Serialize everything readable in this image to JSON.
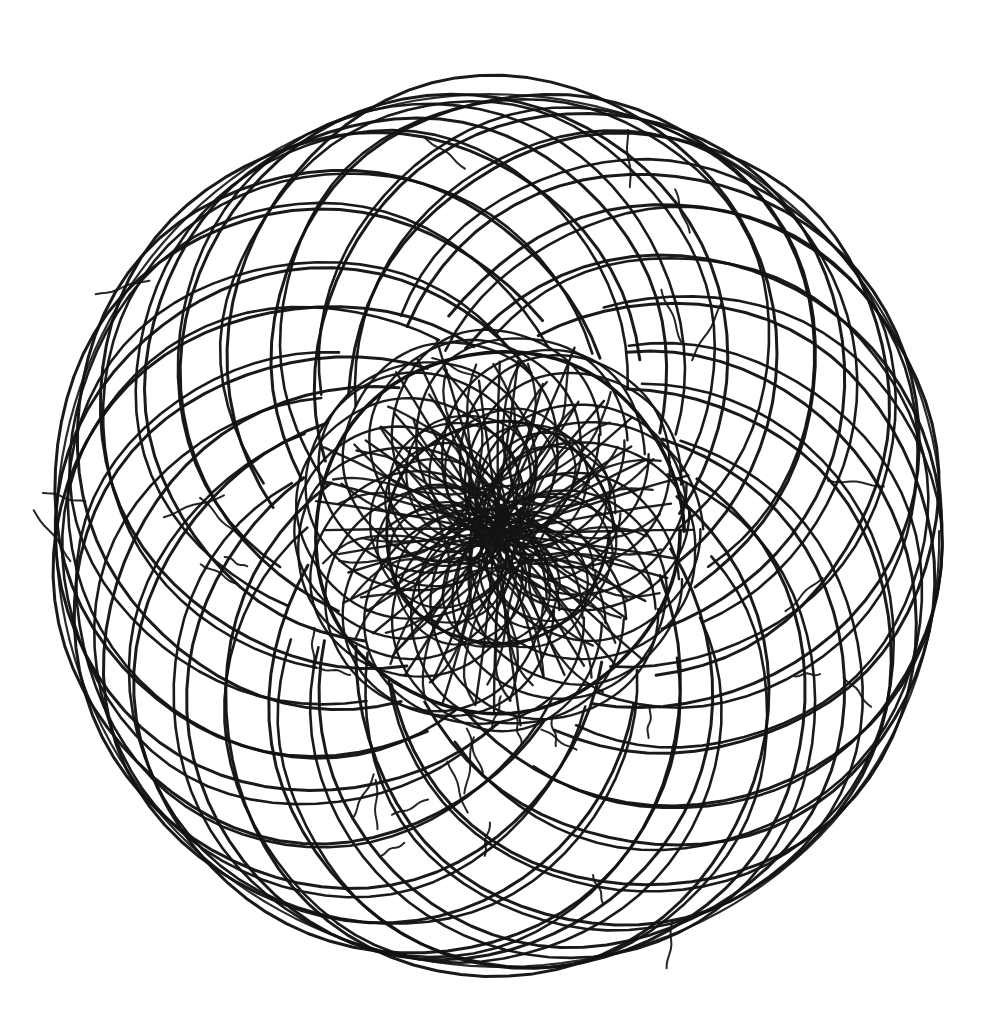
{
  "canvas": {
    "width": 1006,
    "height": 1025,
    "background_color": "#ffffff",
    "ink_color": "#131313"
  },
  "artwork": {
    "title": "Hand-drawn spirograph rosette",
    "medium": "pen on paper",
    "style": "hand-drawn geometric mandala"
  },
  "chart_data": {
    "type": "scatter",
    "xlabel": "",
    "ylabel": "",
    "grid": false,
    "legend": false,
    "center": {
      "x": 497,
      "y": 530
    },
    "overall_bounds": {
      "left": 55,
      "top": 78,
      "right": 938,
      "bottom": 988
    },
    "overall_radius": 442,
    "layers": [
      {
        "name": "outer-petal-arcs",
        "description": "Large equal-radius circles whose centers lie on a ring, sweeping outward into a spiral rosette",
        "count": 24,
        "circle_radius": 268,
        "center_ring_radius": 176,
        "start_angle_deg": 0,
        "angle_step_deg": 15,
        "stroke_width": 3.0,
        "arc_span_deg": 268,
        "arc_offset_deg": -134
      },
      {
        "name": "secondary-petal-arcs",
        "description": "Second interleaved family of large arcs offset by half a step",
        "count": 24,
        "circle_radius": 252,
        "center_ring_radius": 186,
        "start_angle_deg": 7.5,
        "angle_step_deg": 15,
        "stroke_width": 2.6,
        "arc_span_deg": 250,
        "arc_offset_deg": -125
      },
      {
        "name": "inner-dense-ring-circles",
        "description": "Smaller circles forming the heavy dark annulus around the core",
        "count": 24,
        "circle_radius": 108,
        "center_ring_radius": 92,
        "start_angle_deg": 0,
        "angle_step_deg": 15,
        "stroke_width": 2.4
      },
      {
        "name": "core-ring-circles",
        "description": "Innermost circles creating the flower core",
        "count": 18,
        "circle_radius": 62,
        "center_ring_radius": 58,
        "start_angle_deg": 5,
        "angle_step_deg": 20,
        "stroke_width": 2.2
      },
      {
        "name": "center-chords",
        "description": "Near-straight chords radiating through the exact center point",
        "count": 22,
        "chord_length": 352,
        "angle_step_deg": 8.18,
        "stroke_width": 2.4
      },
      {
        "name": "boundary-circle",
        "description": "Faint outermost envelope circle of the whole rosette",
        "radius": 440,
        "stroke_width": 2.2
      },
      {
        "name": "inner-envelope-circle",
        "description": "Dark envelope circle bounding the dense middle band",
        "radius": 182,
        "stroke_width": 3.6
      },
      {
        "name": "core-envelope-circle",
        "description": "Envelope circle bounding the flower core",
        "radius": 112,
        "stroke_width": 3.0
      },
      {
        "name": "stray-tails",
        "description": "Short overshoot pen strokes where arcs were started or ended",
        "count": 34,
        "stroke_width": 2.0,
        "length": 46
      }
    ]
  }
}
